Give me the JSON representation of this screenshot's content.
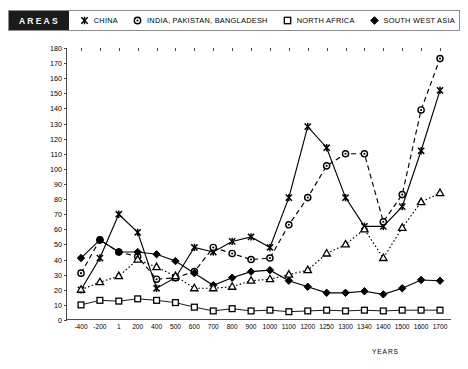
{
  "legend": {
    "title": "AREAS",
    "items": [
      {
        "label": "CHINA",
        "marker": "cross-star-icon",
        "key": "china"
      },
      {
        "label": "INDIA, PAKISTAN, BANGLADESH",
        "marker": "filled-circle-icon",
        "key": "india"
      },
      {
        "label": "NORTH AFRICA",
        "marker": "open-square-icon",
        "key": "north_africa"
      },
      {
        "label": "SOUTH WEST ASIA",
        "marker": "filled-diamond-icon",
        "key": "sw_asia"
      },
      {
        "label": "EUROPE W/OUT USSR",
        "marker": "open-triangle-icon",
        "key": "europe"
      }
    ]
  },
  "chart_data": {
    "type": "line",
    "title": "",
    "xlabel": "YEARS",
    "ylabel": "MILLIONS OF PEOPLE",
    "categories": [
      "-400",
      "-200",
      "1",
      "200",
      "400",
      "500",
      "600",
      "700",
      "800",
      "900",
      "1000",
      "1100",
      "1200",
      "1250",
      "1300",
      "1340",
      "1400",
      "1500",
      "1600",
      "1700"
    ],
    "ylim": [
      0,
      180
    ],
    "yticks": [
      0,
      10,
      20,
      30,
      40,
      50,
      60,
      70,
      80,
      90,
      100,
      110,
      120,
      130,
      140,
      150,
      160,
      170,
      180
    ],
    "grid": false,
    "legend_position": "top",
    "series": [
      {
        "name": "CHINA",
        "marker": "cross-star-icon",
        "line": "solid",
        "values": [
          20,
          41,
          70,
          58,
          21,
          28,
          48,
          45,
          52,
          55,
          48,
          81,
          128,
          114,
          81,
          62,
          62,
          75,
          112,
          152
        ]
      },
      {
        "name": "INDIA, PAKISTAN, BANGLADESH",
        "marker": "filled-circle-icon",
        "line": "dashed",
        "values": [
          31,
          53,
          45,
          42,
          27,
          28,
          32,
          48,
          44,
          40,
          41,
          63,
          81,
          102,
          110,
          110,
          65,
          83,
          139,
          173
        ]
      },
      {
        "name": "NORTH AFRICA",
        "marker": "open-square-icon",
        "line": "solid-thin",
        "values": [
          10,
          13,
          12.5,
          14,
          13,
          11.5,
          8.5,
          6,
          7.5,
          6,
          6.5,
          5.5,
          6,
          6.5,
          6,
          6.5,
          6,
          6.5,
          6.5,
          6.5
        ]
      },
      {
        "name": "SOUTH WEST ASIA",
        "marker": "filled-diamond-icon",
        "line": "solid",
        "values": [
          41,
          53,
          45,
          45,
          43.5,
          39,
          31,
          23,
          28,
          32,
          33,
          26,
          22,
          18,
          18,
          19,
          17,
          21,
          26.5,
          26
        ]
      },
      {
        "name": "EUROPE W/OUT USSR",
        "marker": "open-triangle-icon",
        "line": "dotted",
        "values": [
          20,
          25,
          29,
          40,
          35,
          29,
          21,
          21,
          22,
          26,
          27,
          30,
          33,
          44,
          50,
          60,
          41,
          61,
          78,
          84
        ]
      }
    ]
  }
}
